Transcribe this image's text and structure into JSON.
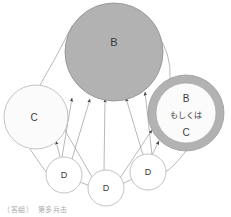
{
  "diagram": {
    "type": "node-graph",
    "background_color": "#ffffff",
    "edge_color": "#9a9a9a",
    "nodes": [
      {
        "id": "B",
        "label": "B",
        "shape": "circle",
        "fill_color": "#b2b2b2",
        "stroke_color": "#8e8e8e",
        "cx": 114,
        "cy": 52,
        "r": 49
      },
      {
        "id": "C",
        "label": "C",
        "shape": "circle",
        "fill_color": "#fbfbfb",
        "stroke_color": "#b4b4b4",
        "cx": 36,
        "cy": 117,
        "r": 32
      },
      {
        "id": "BorC",
        "label_line1": "B",
        "label_line2": "もしくは",
        "label_line3": "C",
        "shape": "ring",
        "ring_color": "#b2b2b2",
        "fill_color": "#fbfbfb",
        "stroke_color": "#9a9a9a",
        "cx": 186,
        "cy": 113,
        "r_outer": 38,
        "r_inner": 30
      },
      {
        "id": "D1",
        "label": "D",
        "shape": "circle",
        "fill_color": "#ffffff",
        "stroke_color": "#b4b4b4",
        "cx": 64,
        "cy": 175,
        "r": 18
      },
      {
        "id": "D2",
        "label": "D",
        "shape": "circle",
        "fill_color": "#ffffff",
        "stroke_color": "#b4b4b4",
        "cx": 106,
        "cy": 188,
        "r": 18
      },
      {
        "id": "D3",
        "label": "D",
        "shape": "circle",
        "fill_color": "#ffffff",
        "stroke_color": "#b4b4b4",
        "cx": 148,
        "cy": 172,
        "r": 18
      }
    ],
    "edges": [
      {
        "from": "C",
        "to": "B",
        "arrow": false,
        "style": "curve"
      },
      {
        "from": "B",
        "to": "BorC",
        "arrow": false,
        "style": "curve"
      },
      {
        "from": "D1",
        "to": "B",
        "arrow": true,
        "style": "line"
      },
      {
        "from": "D2",
        "to": "B",
        "arrow": true,
        "style": "line"
      },
      {
        "from": "D3",
        "to": "B",
        "arrow": true,
        "style": "line"
      },
      {
        "from": "D2",
        "to": "B",
        "arrow": true,
        "style": "line"
      },
      {
        "from": "D1",
        "to": "C",
        "arrow": true,
        "style": "line"
      },
      {
        "from": "D2",
        "to": "C",
        "arrow": true,
        "style": "line"
      },
      {
        "from": "D2",
        "to": "BorC",
        "arrow": true,
        "style": "line"
      },
      {
        "from": "D3",
        "to": "BorC",
        "arrow": true,
        "style": "line"
      },
      {
        "from": "D1",
        "to": "D2",
        "arrow": false,
        "style": "line"
      },
      {
        "from": "D2",
        "to": "D3",
        "arrow": false,
        "style": "line"
      },
      {
        "from": "D1",
        "to": "C",
        "arrow": false,
        "style": "line"
      },
      {
        "from": "D3",
        "to": "BorC",
        "arrow": false,
        "style": "line"
      }
    ]
  },
  "caption": {
    "text": "（答組）　第多兵击"
  }
}
